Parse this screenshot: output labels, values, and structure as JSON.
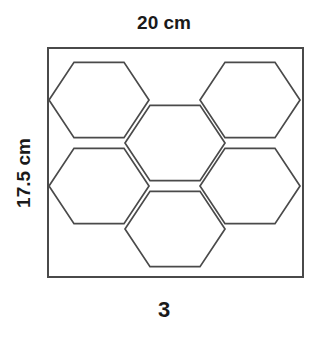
{
  "figure": {
    "type": "geometry-diagram",
    "number_label": "3",
    "top_dimension": "20 cm",
    "left_dimension": "17.5 cm",
    "stroke_color": "#4a4a4a",
    "border_color": "#4a4a4a",
    "background_color": "#ffffff",
    "text_color": "#1a1a1a"
  },
  "chart_data": {
    "type": "diagram",
    "title": "3",
    "xlabel": "20 cm",
    "ylabel": "17.5 cm",
    "rectangle": {
      "x": 48,
      "y": 48,
      "width": 255,
      "height": 229,
      "width_cm": 20,
      "height_cm": 17.5
    },
    "hexagon": {
      "orientation": "flat-top",
      "circumradius_px": 50,
      "count": 6
    },
    "hexagon_centers": [
      {
        "name": "top-left",
        "cx": 99,
        "cy": 100
      },
      {
        "name": "top-right",
        "cx": 250,
        "cy": 100
      },
      {
        "name": "center-upper",
        "cx": 175,
        "cy": 143
      },
      {
        "name": "middle-left",
        "cx": 99,
        "cy": 186
      },
      {
        "name": "middle-right",
        "cx": 250,
        "cy": 186
      },
      {
        "name": "bottom-center",
        "cx": 175,
        "cy": 229
      }
    ]
  }
}
